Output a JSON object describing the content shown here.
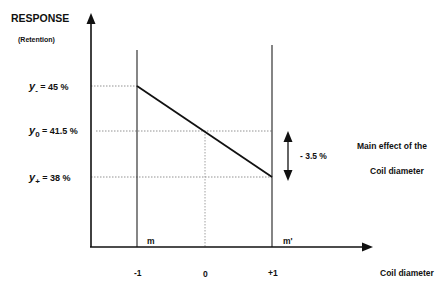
{
  "diagram": {
    "y_axis_title": "RESPONSE",
    "y_axis_subtitle": "(Retention)",
    "x_axis_title": "Coil diameter",
    "levels": [
      {
        "symbol": "y",
        "subscript": "-",
        "value_text": "= 45 %",
        "value": 45
      },
      {
        "symbol": "y",
        "subscript": "0",
        "value_text": "= 41.5 %",
        "value": 41.5
      },
      {
        "symbol": "y",
        "subscript": "+",
        "value_text": "= 38 %",
        "value": 38
      }
    ],
    "x_ticks": [
      "-1",
      "0",
      "+1"
    ],
    "point_labels": {
      "low": "m",
      "high": "m'"
    },
    "effect": {
      "delta_text": "- 3.5 %",
      "label_line1": "Main effect of the",
      "label_line2": "Coil diameter"
    },
    "line": {
      "from": {
        "x": -1,
        "y": 45
      },
      "to": {
        "x": 1,
        "y": 38
      }
    }
  }
}
